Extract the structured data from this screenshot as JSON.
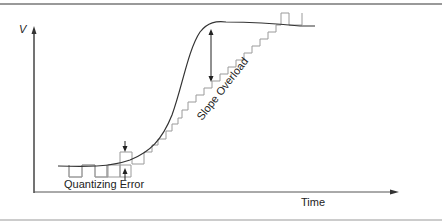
{
  "figure": {
    "y_axis_label": "V",
    "x_axis_label": "Time",
    "annotations": {
      "quantizing_error": "Quantizing Error",
      "slope_overload": "Slope Overload"
    }
  },
  "colors": {
    "curve": "#333333",
    "staircase": "#9a9a9a",
    "axes": "#444444",
    "rule": "#777777"
  }
}
